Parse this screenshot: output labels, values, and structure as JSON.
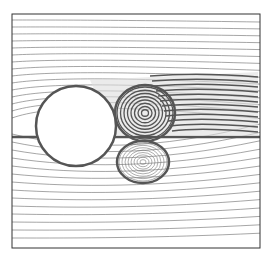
{
  "figure": {
    "type": "streamline-plot",
    "frame": {
      "x": 12,
      "y": 14,
      "width": 248,
      "height": 234
    },
    "cylinder": {
      "cx": 76,
      "cy": 126,
      "r": 40
    },
    "vortices": [
      {
        "name": "upper-vortex",
        "cx": 145,
        "cy": 113,
        "rx": 28,
        "ry": 26
      },
      {
        "name": "lower-vortex",
        "cx": 143,
        "cy": 162,
        "rx": 24,
        "ry": 19
      }
    ],
    "colors": {
      "lines": "#6a6a6a",
      "dense": "#555555",
      "frame": "#333333",
      "background": "#ffffff"
    }
  }
}
